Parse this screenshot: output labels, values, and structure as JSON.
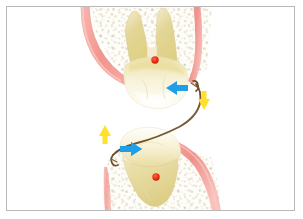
{
  "figure": {
    "title": "Orthodontic force diagram of opposing teeth connected by an arch wire",
    "background_color": "#ffffff",
    "border_color": "#b9b9b9"
  },
  "palette": {
    "gingiva_pink": "#f2968f",
    "gingiva_pink_light": "#f9c3bd",
    "tooth_enamel": "#fdfcf6",
    "tooth_dentin": "#e9dda2",
    "tooth_root_yellow": "#ddcf8c",
    "bone_speckle": "#c9c3b4",
    "wire_brown": "#7a5c35",
    "arrow_blue": "#1f9fe8",
    "arrow_yellow": "#ffe02a",
    "center_of_resistance_red": "#e8241a",
    "outline_gray": "#cfcabb"
  },
  "elements": {
    "upper_tooth": {
      "name": "upper molar",
      "position": "top",
      "root_count": 2,
      "center_of_resistance": {
        "x": 155,
        "y": 60,
        "radius": 3.6,
        "color": "#e8241a"
      }
    },
    "lower_tooth": {
      "name": "lower molar",
      "position": "bottom",
      "root_count": 1,
      "center_of_resistance": {
        "x": 156,
        "y": 177,
        "radius": 3.6,
        "color": "#e8241a"
      }
    },
    "arch_wire": {
      "name": "arch wire",
      "shape": "s-curve",
      "color": "#7a5c35",
      "from": {
        "x": 196,
        "y": 84
      },
      "to": {
        "x": 112,
        "y": 154
      }
    },
    "bone_upper": {
      "name": "alveolar bone, maxilla",
      "texture": "trabecular speckle"
    },
    "bone_lower": {
      "name": "alveolar bone, mandible",
      "texture": "trabecular speckle"
    },
    "gingiva_upper_left": {
      "name": "upper left gingiva",
      "color": "#f2968f"
    },
    "gingiva_upper_right": {
      "name": "upper right gingiva",
      "color": "#f2968f"
    },
    "gingiva_lower_right": {
      "name": "lower right gingiva",
      "color": "#f2968f"
    }
  },
  "arrows": [
    {
      "id": "upper-horizontal-force",
      "label": "blue arrow pointing left",
      "direction": "left",
      "color": "#1f9fe8",
      "x": 166,
      "y": 88,
      "length": 22,
      "thickness": 7
    },
    {
      "id": "upper-vertical-force",
      "label": "yellow arrow pointing down",
      "direction": "down",
      "color": "#ffe02a",
      "x": 202,
      "y": 92,
      "length": 19,
      "thickness": 7
    },
    {
      "id": "lower-horizontal-force",
      "label": "blue arrow pointing right",
      "direction": "right",
      "color": "#1f9fe8",
      "x": 119,
      "y": 149,
      "length": 22,
      "thickness": 7
    },
    {
      "id": "lower-vertical-force",
      "label": "yellow arrow pointing up",
      "direction": "up",
      "color": "#ffe02a",
      "x": 104,
      "y": 126,
      "length": 19,
      "thickness": 7
    }
  ],
  "caption": ""
}
